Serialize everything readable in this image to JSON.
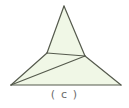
{
  "figure": {
    "caption": "( c )",
    "label_letter": "c",
    "background_color": "#ffffff",
    "fill_color": "#f0f7e6",
    "stroke_color": "#555a4d",
    "caption_color": "#6b6b6b",
    "stroke_width": 1.2,
    "canvas": {
      "width": 129,
      "height": 108
    },
    "points": {
      "apex": {
        "x": 64,
        "y": 6,
        "name": "top-apex"
      },
      "upper_left": {
        "x": 47,
        "y": 53,
        "name": "upper-triangle-left-base"
      },
      "upper_right": {
        "x": 85,
        "y": 56,
        "name": "upper-triangle-right-base"
      },
      "bottom_left": {
        "x": 11,
        "y": 85,
        "name": "base-left-vertex"
      },
      "bottom_right": {
        "x": 121,
        "y": 85,
        "name": "base-right-vertex"
      }
    },
    "shapes": [
      {
        "name": "upper-triangle",
        "type": "polygon",
        "vertices": [
          [
            64,
            6
          ],
          [
            85,
            56
          ],
          [
            47,
            53
          ]
        ]
      },
      {
        "name": "base-polygon",
        "type": "polygon",
        "vertices": [
          [
            47,
            53
          ],
          [
            85,
            56
          ],
          [
            121,
            85
          ],
          [
            11,
            85
          ]
        ]
      }
    ],
    "segments": [
      {
        "name": "apex-to-upper-left",
        "from": [
          64,
          6
        ],
        "to": [
          47,
          53
        ]
      },
      {
        "name": "apex-to-upper-right",
        "from": [
          64,
          6
        ],
        "to": [
          85,
          56
        ]
      },
      {
        "name": "upper-base-horizontal",
        "from": [
          47,
          53
        ],
        "to": [
          85,
          56
        ]
      },
      {
        "name": "bottom-left-to-upper-left",
        "from": [
          11,
          85
        ],
        "to": [
          47,
          53
        ]
      },
      {
        "name": "bottom-left-to-upper-right-diagonal",
        "from": [
          11,
          85
        ],
        "to": [
          85,
          56
        ]
      },
      {
        "name": "upper-right-to-bottom-right",
        "from": [
          85,
          56
        ],
        "to": [
          121,
          85
        ]
      },
      {
        "name": "base-bottom-edge",
        "from": [
          11,
          85
        ],
        "to": [
          121,
          85
        ]
      }
    ]
  }
}
